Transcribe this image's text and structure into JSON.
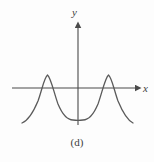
{
  "figure": {
    "caption": "(d)",
    "background_color": "#fdfdfd",
    "axis_color": "#4a4a4a",
    "curve_color": "#5a5a5a",
    "label_color": "#3d3d3d"
  },
  "axes": {
    "x_label": "x",
    "y_label": "y",
    "x_axis_y_pixel": 88,
    "y_axis_x_pixel": 78,
    "x_axis_start_px": 12,
    "x_axis_end_px": 141,
    "y_axis_top_px": 22,
    "y_axis_bottom_px": 125
  },
  "chart_data": {
    "type": "line",
    "title": "(d)",
    "xlabel": "x",
    "ylabel": "y",
    "grid": false,
    "legend": null,
    "xlim": [
      -3.2,
      3.2
    ],
    "ylim": [
      -1.3,
      1.1
    ],
    "x": [
      -3.2,
      -2.8,
      -2.4,
      -2.0,
      -1.6,
      -1.2,
      -0.8,
      -0.4,
      0.0,
      0.4,
      0.8,
      1.2,
      1.6,
      2.0,
      2.4,
      2.8,
      3.2
    ],
    "y": [
      -1.05,
      -0.72,
      -0.16,
      0.45,
      0.83,
      0.85,
      0.42,
      -0.32,
      -0.85,
      -0.32,
      0.42,
      0.85,
      0.83,
      0.45,
      -0.16,
      -0.72,
      -1.05
    ],
    "features": {
      "left_maximum": {
        "x": -1.4,
        "y": 0.86
      },
      "right_maximum": {
        "x": 1.4,
        "y": 0.86
      },
      "central_minimum": {
        "x": 0.0,
        "y": -0.85
      },
      "x_intercepts": [
        -2.45,
        -0.52,
        0.52,
        2.45
      ]
    },
    "curve_path": "M 22,123 C 27,121 33,113 38,101 C 42,90 44,78 47.5,75 C 51,78 54,93 58,104 C 63,116 69,120 73,120 C 75.5,120.3 76.5,120.3 78,120.3 C 79.5,120.3 80.5,120.3 83,120 C 87,120 93,116 98,104 C 102,93 105,78 108.5,75 C 112,78 114,90 118,101 C 123,113 129,121 133,123"
  }
}
